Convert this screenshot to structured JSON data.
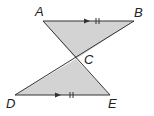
{
  "diagram": {
    "type": "geometry",
    "fill_color": "#d3d3d3",
    "stroke_color": "#333333",
    "points": {
      "A": {
        "label": "A",
        "x": 43,
        "y": 21
      },
      "B": {
        "label": "B",
        "x": 134,
        "y": 21
      },
      "C": {
        "label": "C",
        "x": 76,
        "y": 59
      },
      "D": {
        "label": "D",
        "x": 15,
        "y": 95
      },
      "E": {
        "label": "E",
        "x": 110,
        "y": 95
      }
    },
    "triangles": [
      {
        "name": "ABC",
        "vertices": [
          "A",
          "B",
          "C"
        ]
      },
      {
        "name": "DCE",
        "vertices": [
          "D",
          "C",
          "E"
        ]
      }
    ],
    "parallel_marks": [
      {
        "segment": "AB",
        "marker": "arrow + double tick"
      },
      {
        "segment": "DE",
        "marker": "arrow + double tick"
      }
    ]
  }
}
